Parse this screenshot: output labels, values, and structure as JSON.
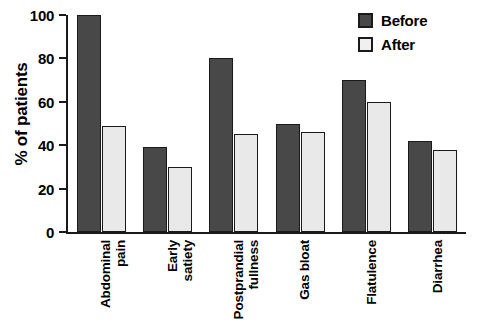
{
  "chart_data": {
    "type": "bar",
    "title": "",
    "xlabel": "",
    "ylabel": "% of patients",
    "ylim": [
      0,
      100
    ],
    "yticks": [
      0,
      20,
      40,
      60,
      80,
      100
    ],
    "ytick_labels": [
      "0",
      "20",
      "40",
      "60",
      "80",
      "100"
    ],
    "grid": false,
    "legend_position": "top-right",
    "categories": [
      "Abdominal\npain",
      "Early\nsatiety",
      "Postprandial\nfullness",
      "Gas bloat",
      "Flatulence",
      "Diarrhea"
    ],
    "series": [
      {
        "name": "Before",
        "color": "#484848",
        "values": [
          100,
          39,
          80,
          50,
          70,
          42
        ]
      },
      {
        "name": "After",
        "color": "#e9e9e9",
        "values": [
          49,
          30,
          45,
          46,
          60,
          38
        ]
      }
    ]
  },
  "legend": {
    "items": [
      {
        "label": "Before"
      },
      {
        "label": "After"
      }
    ]
  }
}
